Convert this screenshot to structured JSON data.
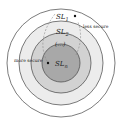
{
  "diagram": {
    "type": "concentric-security-levels",
    "levels": [
      {
        "label": "SL",
        "sub": "1",
        "fill": "#ffffff",
        "r": 54
      },
      {
        "label": "SL",
        "sub": "2",
        "fill": "#ececec",
        "r": 42
      },
      {
        "label": "(...)",
        "sub": "",
        "fill": "#d2d2d2",
        "r": 30
      },
      {
        "label": "SL",
        "sub": "n",
        "fill": "#a8a8a8",
        "r": 19
      }
    ],
    "annotations": {
      "less_secure": "less secure",
      "more_secure": "more secure"
    },
    "colors": {
      "stroke": "#444444",
      "arrow": "#888888"
    }
  }
}
